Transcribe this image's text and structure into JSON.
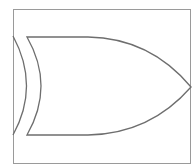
{
  "diagram": {
    "type": "logic-gate",
    "gate": "XOR",
    "colors": {
      "line": "#6e6e6e",
      "frame": "#9a9a9a",
      "background": "#ffffff"
    }
  }
}
